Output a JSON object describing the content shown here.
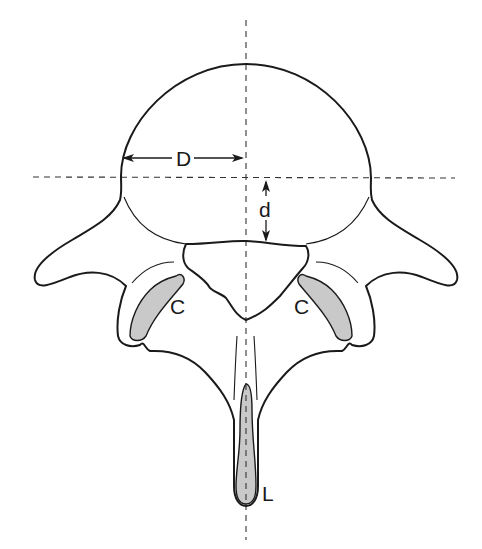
{
  "diagram": {
    "labels": {
      "D": "D",
      "d": "d",
      "C_left": "C",
      "C_right": "C",
      "L": "L"
    },
    "measurements": [
      {
        "label": "D",
        "orientation": "horizontal",
        "description": "half-width of vertebral body from left edge to midline"
      },
      {
        "label": "d",
        "orientation": "vertical",
        "description": "distance from transverse midline to posterior body margin"
      }
    ],
    "reference_lines": [
      {
        "orientation": "vertical",
        "style": "dashed",
        "position": "midline"
      },
      {
        "orientation": "horizontal",
        "style": "dashed",
        "position": "body mid-transverse"
      }
    ],
    "shaded_regions": [
      "left C",
      "right C",
      "L (spinous process)"
    ],
    "colors": {
      "stroke": "#1a1a1a",
      "shade": "#c9c9c9",
      "background": "#ffffff"
    }
  }
}
